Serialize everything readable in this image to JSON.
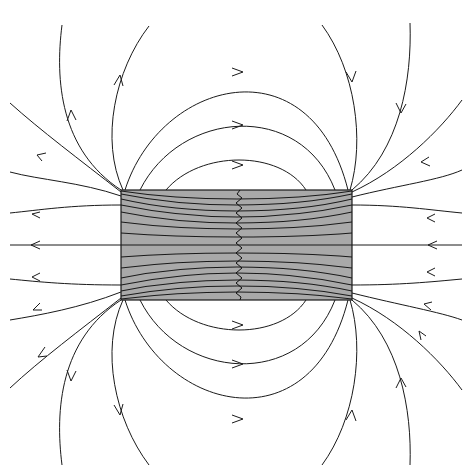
{
  "diagram": {
    "colors": {
      "background": "#ffffff",
      "magnet_fill": "#a9a9a9",
      "line": "#1a1a1a"
    },
    "magnet": {
      "x": 121,
      "y": 190,
      "width": 231,
      "height": 110
    },
    "field_line_count_outside": 18,
    "field_line_count_inside": 14,
    "arrow_direction": "outside: right pole to left pole via loops; axis lines pointing left"
  }
}
